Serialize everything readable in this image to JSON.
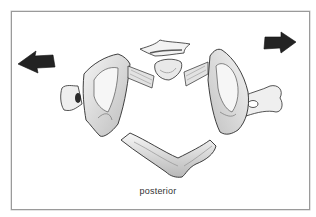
{
  "figure": {
    "caption": "posterior",
    "frame_color": "#9a9a9a",
    "ink_color": "#2b2b2b",
    "arrows": [
      {
        "name": "left-arrow",
        "direction": "left"
      },
      {
        "name": "right-arrow",
        "direction": "right"
      }
    ],
    "parts": [
      {
        "name": "anterior-arch",
        "position": "top-center"
      },
      {
        "name": "dens-facet",
        "position": "center"
      },
      {
        "name": "left-lateral-mass",
        "position": "left"
      },
      {
        "name": "right-lateral-mass",
        "position": "right"
      },
      {
        "name": "posterior-arch",
        "position": "bottom-center"
      }
    ]
  }
}
